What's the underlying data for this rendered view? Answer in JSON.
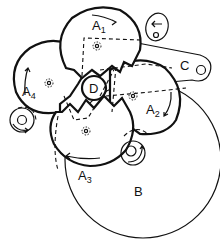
{
  "diagram": {
    "type": "mechanical-gear-mechanism",
    "components": {
      "A1": {
        "label": "A",
        "sub": "1"
      },
      "A2": {
        "label": "A",
        "sub": "2"
      },
      "A3": {
        "label": "A",
        "sub": "3"
      },
      "A4": {
        "label": "A",
        "sub": "4"
      },
      "B": {
        "label": "B"
      },
      "C": {
        "label": "C"
      },
      "D": {
        "label": "D"
      }
    },
    "colors": {
      "stroke": "#111111",
      "background": "#ffffff"
    }
  }
}
